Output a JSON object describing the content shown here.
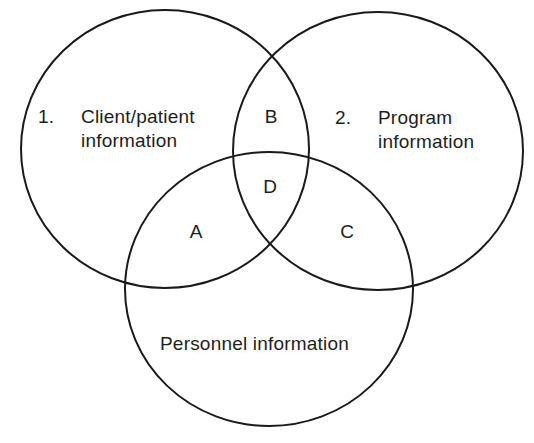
{
  "diagram": {
    "type": "venn",
    "sets": [
      {
        "id": "set-1",
        "number": "1.",
        "title_line1": "Client/patient",
        "title_line2": "information"
      },
      {
        "id": "set-2",
        "number": "2.",
        "title_line1": "Program",
        "title_line2": "information"
      },
      {
        "id": "set-3",
        "title": "Personnel information"
      }
    ],
    "regions": {
      "A": "A",
      "B": "B",
      "C": "C",
      "D": "D"
    },
    "region_meaning": {
      "A": "Client/patient ∩ Personnel",
      "B": "Client/patient ∩ Program",
      "C": "Program ∩ Personnel",
      "D": "Client/patient ∩ Program ∩ Personnel"
    },
    "colors": {
      "stroke": "#1a1a1a",
      "text": "#1e1e1e",
      "background": "#ffffff"
    }
  }
}
